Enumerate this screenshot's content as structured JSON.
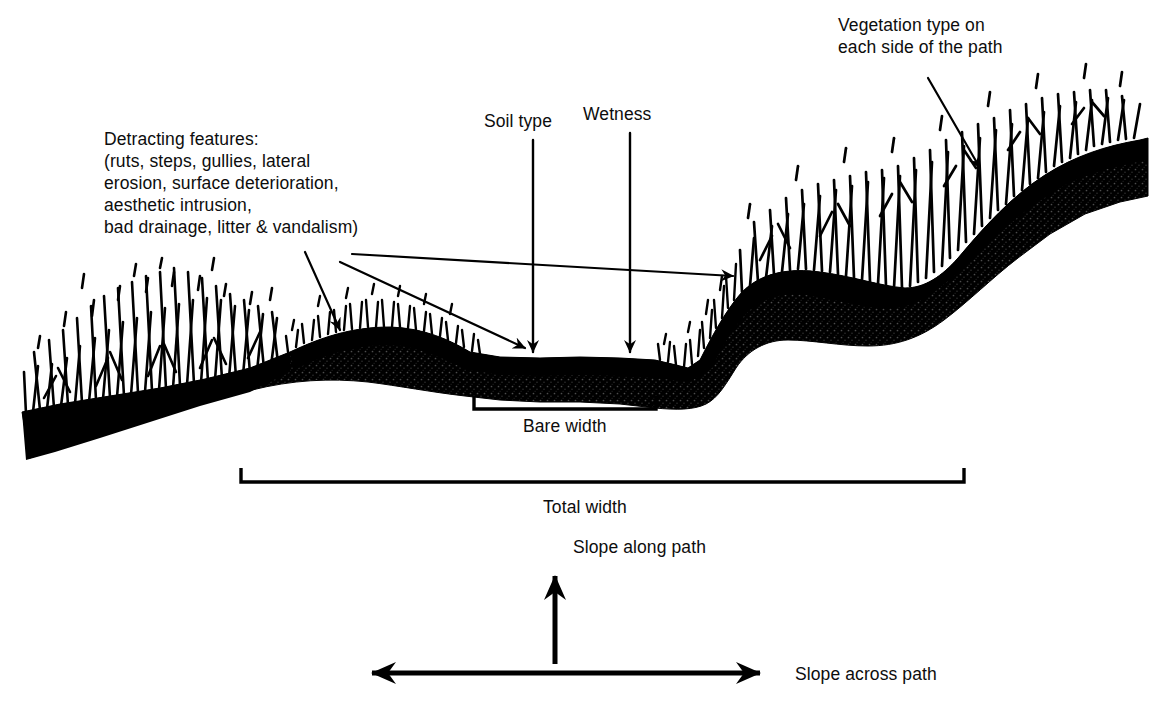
{
  "diagram": {
    "colors": {
      "ink": "#000000",
      "background": "#ffffff"
    },
    "labels": {
      "detracting_features": "Detracting features:\n(ruts, steps, gullies, lateral\nerosion, surface deterioration,\naesthetic intrusion,\nbad drainage, litter & vandalism)",
      "soil_type": "Soil type",
      "wetness": "Wetness",
      "vegetation_type": "Vegetation type on\neach side of the path",
      "bare_width": "Bare width",
      "total_width": "Total width",
      "slope_along_path": "Slope along path",
      "slope_across_path": "Slope across path"
    },
    "annotations": [
      {
        "name": "detracting-features-callout",
        "label": "Detracting features:",
        "arrows": 3,
        "targets": [
          "left hump edge",
          "bare path left edge",
          "far right path shoulder"
        ]
      },
      {
        "name": "soil-type-callout",
        "label": "Soil type",
        "arrows": 1,
        "targets": [
          "bare path surface"
        ]
      },
      {
        "name": "wetness-callout",
        "label": "Wetness",
        "arrows": 1,
        "targets": [
          "bare path surface"
        ]
      },
      {
        "name": "vegetation-type-callout",
        "label": "Vegetation type on each side of the path",
        "arrows": 1,
        "targets": [
          "tall grass on right bank"
        ]
      }
    ],
    "measures": [
      {
        "name": "bare-width",
        "label": "Bare width",
        "span": "narrow, centre of path"
      },
      {
        "name": "total-width",
        "label": "Total width",
        "span": "wide, full disturbed corridor"
      }
    ],
    "slope_axes": [
      {
        "name": "slope-along-path",
        "label": "Slope along path",
        "direction": "vertical, arrow up"
      },
      {
        "name": "slope-across-path",
        "label": "Slope across path",
        "direction": "horizontal, double-headed arrow"
      }
    ]
  }
}
